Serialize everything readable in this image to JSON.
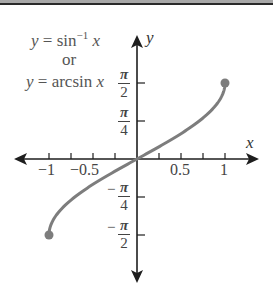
{
  "chart_data": {
    "type": "line",
    "title": "",
    "legend": [
      "y = sin⁻¹ x",
      "or",
      "y = arcsin x"
    ],
    "function": "arcsin",
    "xlabel": "x",
    "ylabel": "y",
    "xlim": [
      -1.35,
      1.37
    ],
    "ylim": [
      -2.55,
      2.55
    ],
    "x_ticks": [
      -1,
      -0.75,
      -0.5,
      -0.25,
      0.25,
      0.5,
      0.75,
      1
    ],
    "x_tick_labels": [
      {
        "value": -1,
        "label": "−1"
      },
      {
        "value": -0.5,
        "label": "−0.5"
      },
      {
        "value": 0.5,
        "label": "0.5"
      },
      {
        "value": 1,
        "label": "1"
      }
    ],
    "y_tick_labels": [
      {
        "value": 1.5708,
        "num": "π",
        "den": "2",
        "neg": false
      },
      {
        "value": 0.7854,
        "num": "π",
        "den": "4",
        "neg": false
      },
      {
        "value": -0.7854,
        "num": "π",
        "den": "4",
        "neg": true
      },
      {
        "value": -1.5708,
        "num": "π",
        "den": "2",
        "neg": true
      }
    ],
    "series": [
      {
        "name": "y = arcsin x",
        "x": [
          -1,
          -0.9,
          -0.75,
          -0.5,
          -0.25,
          0,
          0.25,
          0.5,
          0.75,
          0.9,
          1
        ],
        "y": [
          -1.5708,
          -1.1198,
          -0.8481,
          -0.5236,
          -0.2527,
          0,
          0.2527,
          0.5236,
          0.8481,
          1.1198,
          1.5708
        ],
        "endpoints": [
          [
            -1,
            -1.5708
          ],
          [
            1,
            1.5708
          ]
        ],
        "color": "#7d7d7d"
      }
    ],
    "grid": false
  },
  "labels": {
    "eq1_y": "y",
    "eq1_mid": " = sin",
    "eq1_sup": "−1",
    "eq1_x": " x",
    "eq2": "or",
    "eq3_y": "y",
    "eq3_mid": " = arcsin ",
    "eq3_x": "x",
    "axis_x": "x",
    "axis_y": "y",
    "xt_m1": "−1",
    "xt_m05": "−0.5",
    "xt_05": "0.5",
    "xt_1": "1",
    "pi": "π",
    "two": "2",
    "four": "4",
    "minus": "−"
  },
  "colors": {
    "curve": "#7d7d7d",
    "axis": "#1e1e1e",
    "label": "#555555"
  }
}
